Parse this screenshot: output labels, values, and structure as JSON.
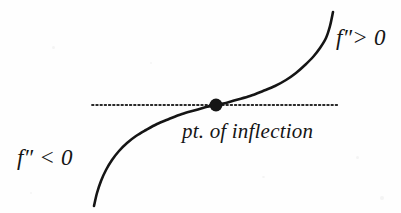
{
  "figure": {
    "name": "point-of-inflection-diagram",
    "background_color": "#fefefe",
    "ink_color": "#151515",
    "width": 401,
    "height": 213
  },
  "labels": {
    "concave_up": "f″> 0",
    "concave_down": "f″ < 0",
    "inflection_point": "pt. of inflection"
  },
  "chart_data": {
    "type": "line",
    "title": "",
    "subtitle": "",
    "xlabel": "",
    "ylabel": "",
    "grid": false,
    "legend_position": "none",
    "axis_visible": false,
    "xlim": [
      94,
      338
    ],
    "ylim": [
      12,
      206
    ],
    "annotations": [
      {
        "name": "concave-up-region-label",
        "text": "f″> 0",
        "x": 337,
        "y": 40,
        "meaning": "second derivative positive, curve concave up"
      },
      {
        "name": "concave-down-region-label",
        "text": "f″ < 0",
        "x": 18,
        "y": 160,
        "meaning": "second derivative negative, curve concave down"
      },
      {
        "name": "inflection-point-label",
        "text": "pt. of inflection",
        "x": 183,
        "y": 135,
        "meaning": "location where concavity changes sign"
      }
    ],
    "series": [
      {
        "name": "cubic-curve",
        "style": "solid",
        "color": "#151515",
        "linewidth": 2.6,
        "description": "Odd-symmetric cubic-like curve, concave down left of the inflection point and concave up right of it, with a horizontal tangent at the inflection point.",
        "points": [
          [
            94,
            206
          ],
          [
            97,
            193
          ],
          [
            101,
            181
          ],
          [
            106,
            170
          ],
          [
            112,
            160
          ],
          [
            119,
            151
          ],
          [
            127,
            143
          ],
          [
            136,
            136
          ],
          [
            146,
            130
          ],
          [
            157,
            124
          ],
          [
            169,
            119
          ],
          [
            182,
            114
          ],
          [
            196,
            110
          ],
          [
            206,
            107
          ],
          [
            216,
            105
          ],
          [
            226,
            103
          ],
          [
            236,
            100
          ],
          [
            250,
            96
          ],
          [
            263,
            91
          ],
          [
            275,
            86
          ],
          [
            286,
            80
          ],
          [
            296,
            73
          ],
          [
            305,
            65
          ],
          [
            313,
            57
          ],
          [
            320,
            48
          ],
          [
            326,
            38
          ],
          [
            330,
            26
          ],
          [
            333,
            12
          ]
        ]
      },
      {
        "name": "tangent-line",
        "style": "dotted",
        "color": "#2a2a2a",
        "linewidth": 1.8,
        "description": "Horizontal dotted tangent line at the inflection point.",
        "points": [
          [
            92,
            105
          ],
          [
            338,
            105
          ]
        ]
      }
    ],
    "markers": [
      {
        "name": "inflection-point-marker",
        "shape": "filled-circle",
        "x": 216,
        "y": 105,
        "radius": 6.5,
        "color": "#151515",
        "label": "pt. of inflection"
      }
    ]
  }
}
